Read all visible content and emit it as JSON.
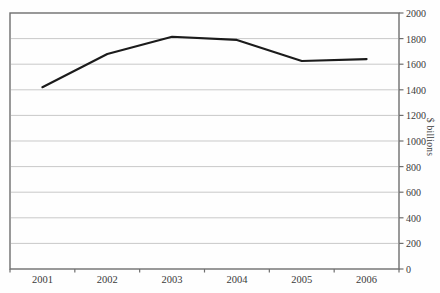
{
  "chart_data": {
    "type": "line",
    "title": "",
    "categories": [
      "2001",
      "2002",
      "2003",
      "2004",
      "2005",
      "2006"
    ],
    "series": [
      {
        "name": "",
        "values": [
          1420,
          1680,
          1815,
          1790,
          1625,
          1640
        ]
      }
    ],
    "xlabel": "",
    "ylabel": "$ billions",
    "ylim": [
      0,
      2000
    ],
    "ytick_interval": 200,
    "ytick_labels": [
      "2000",
      "1800",
      "1600",
      "1400",
      "1200",
      "1000",
      "800",
      "600",
      "400",
      "200",
      "0"
    ],
    "grid": "horizontal",
    "legend": "none",
    "colors": {
      "line": "#1b1b1b",
      "grid": "#c9c9c9",
      "axis": "#6e6e6e",
      "text": "#3a3a3a",
      "background": "#fefefe"
    }
  }
}
